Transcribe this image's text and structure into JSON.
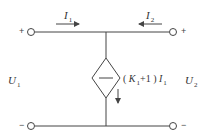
{
  "diagram": {
    "type": "two-port circuit with current-controlled current source",
    "colors": {
      "wire": "#444444",
      "text": "#333333",
      "background": "#ffffff"
    },
    "ports": {
      "left": {
        "plus": "+",
        "minus": "−",
        "voltage_symbol": "U",
        "voltage_subscript": "1"
      },
      "right": {
        "plus": "+",
        "minus": "−",
        "voltage_symbol": "U",
        "voltage_subscript": "2"
      }
    },
    "currents": {
      "i1": {
        "symbol": "I",
        "subscript": "1",
        "direction": "right"
      },
      "i2": {
        "symbol": "I",
        "subscript": "2",
        "direction": "left"
      }
    },
    "source": {
      "kind": "dependent current source (diamond)",
      "label_open": "( ",
      "label_k": "K",
      "label_k_sub": "1",
      "label_plus_one": "+1 ) ",
      "label_i": "I",
      "label_i_sub": "1",
      "direction": "down"
    }
  }
}
